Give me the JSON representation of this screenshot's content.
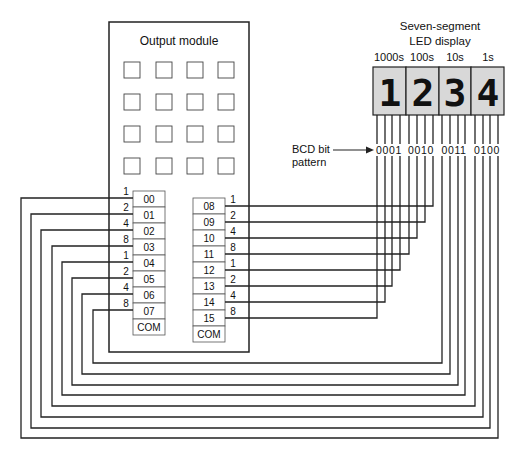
{
  "module": {
    "title": "Output module",
    "indicator_grid": {
      "rows": 4,
      "cols": 4
    },
    "left_block": {
      "terminals": [
        "00",
        "01",
        "02",
        "03",
        "04",
        "05",
        "06",
        "07",
        "COM"
      ],
      "weights": [
        "1",
        "2",
        "4",
        "8",
        "1",
        "2",
        "4",
        "8"
      ]
    },
    "right_block": {
      "terminals": [
        "08",
        "09",
        "10",
        "11",
        "12",
        "13",
        "14",
        "15",
        "COM"
      ],
      "weights": [
        "1",
        "2",
        "4",
        "8",
        "1",
        "2",
        "4",
        "8"
      ]
    }
  },
  "display": {
    "title_line1": "Seven-segment",
    "title_line2": "LED display",
    "places": [
      "1000s",
      "100s",
      "10s",
      "1s"
    ],
    "digits": [
      "1",
      "2",
      "3",
      "4"
    ],
    "bcd_groups": [
      "0001",
      "0010",
      "0011",
      "0100"
    ]
  },
  "annotation": {
    "label_line1": "BCD bit",
    "label_line2": "pattern",
    "arrow": "right-arrow"
  }
}
